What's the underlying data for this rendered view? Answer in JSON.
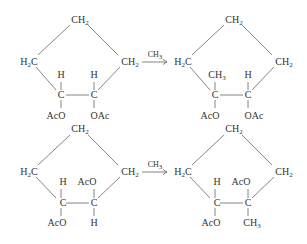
{
  "reactions": [
    {
      "reactant": {
        "top": "CH2",
        "left": "H2C",
        "right": "CH2",
        "c1_up": "H",
        "c1": "C",
        "c1_down": "AcO",
        "c2_up": "H",
        "c2": "C",
        "c2_down": "OAc"
      },
      "reagent": "CH3",
      "product": {
        "top": "CH2",
        "left": "H2C",
        "right": "CH2",
        "c1_up": "CH3",
        "c1": "C",
        "c1_down": "AcO",
        "c2_up": "H",
        "c2": "C",
        "c2_down": "OAc"
      }
    },
    {
      "reactant": {
        "top": "CH2",
        "left": "H2C",
        "right": "CH2",
        "c1_up": "H",
        "c1": "C",
        "c1_down": "AcO",
        "c2_up": "AcO",
        "c2": "C",
        "c2_down": "H"
      },
      "reagent": "CH3",
      "product": {
        "top": "CH2",
        "left": "H2C",
        "right": "CH2",
        "c1_up": "H",
        "c1": "C",
        "c1_down": "AcO",
        "c2_up": "AcO",
        "c2": "C",
        "c2_down": "CH3"
      }
    }
  ]
}
